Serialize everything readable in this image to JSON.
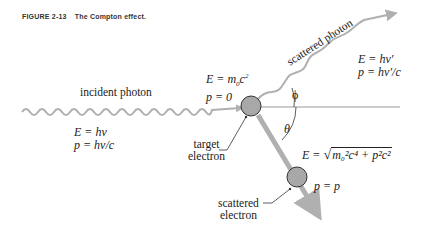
{
  "figure": {
    "number": "FIGURE 2-13",
    "title": "The Compton effect."
  },
  "labels": {
    "incident_photon": "incident photon",
    "scattered_photon": "scattered photon",
    "target_electron_line1": "target",
    "target_electron_line2": "electron",
    "scattered_electron_line1": "scattered",
    "scattered_electron_line2": "electron",
    "phi": "ϕ",
    "theta": "θ"
  },
  "equations": {
    "incident_energy": "E = hν",
    "incident_momentum": "p = hν/c",
    "target_energy_prefix": "E = m",
    "target_energy_sub": "0",
    "target_energy_c": "c",
    "target_energy_sup": "2",
    "target_momentum": "p = 0",
    "scattered_photon_energy": "E = hν′",
    "scattered_photon_momentum": "p = hν′/c",
    "scattered_electron_energy_prefix": "E =",
    "scattered_electron_energy_radicand": "m₀²c⁴ + p²c²",
    "scattered_electron_momentum": "p = p"
  },
  "colors": {
    "wave": "#b0b0b0",
    "electron_fill": "#a8a8a8",
    "electron_stroke": "#333333",
    "reference_line": "#999999",
    "text": "#222222"
  }
}
